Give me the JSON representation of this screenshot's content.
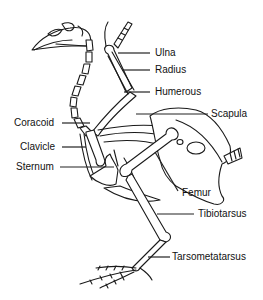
{
  "diagram": {
    "colors": {
      "ink": "#1a1a1a",
      "background": "#ffffff"
    },
    "labels": {
      "ulna": "Ulna",
      "radius": "Radius",
      "humerous": "Humerous",
      "scapula": "Scapula",
      "coracoid": "Coracoid",
      "clavicle": "Clavicle",
      "sternum": "Sternum",
      "femur": "Femur",
      "tibiotarsus": "Tibiotarsus",
      "tarsometatarsus": "Tarsometatarsus"
    }
  }
}
